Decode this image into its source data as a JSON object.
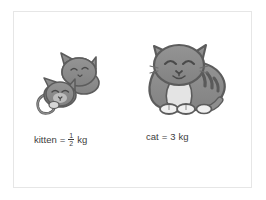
{
  "panel": {
    "background_color": "#ffffff",
    "border_color": "#e6e6e6"
  },
  "illustrations": [
    {
      "name": "kitten",
      "description": "small curled grey kitten lying down with curled tail",
      "body_color": "#8a8a8a",
      "outline_color": "#5c5c5c",
      "belly_color": "#d9d9d9"
    },
    {
      "name": "cat",
      "description": "large fat grey striped cat sitting with closed smiling eyes, white chest, white paws and white tail tip",
      "body_color": "#8a8a8a",
      "outline_color": "#5c5c5c",
      "belly_color": "#e2e2e2",
      "stripe_color": "#5c5c5c"
    }
  ],
  "labels": {
    "kitten": {
      "subject": "kitten",
      "equals": "=",
      "value_numerator": "1",
      "value_denominator": "2",
      "unit": "kg",
      "full_text": "kitten = 1/2 kg"
    },
    "cat": {
      "subject": "cat",
      "equals": "=",
      "value": "3",
      "unit": "kg",
      "full_text": "cat = 3 kg"
    }
  },
  "text_color": "#3d3d3d"
}
